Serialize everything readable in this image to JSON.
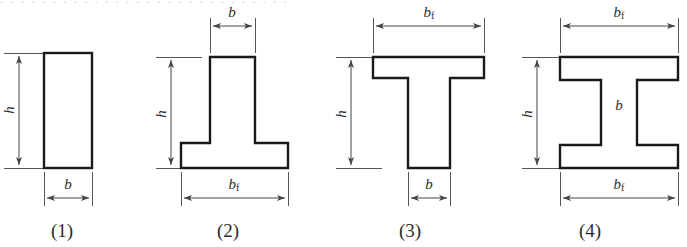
{
  "figure": {
    "background_color": "#ffffff",
    "outline_color": "#1a1a1a",
    "dimension_line_color": "#555555",
    "text_color": "#2b2b2b",
    "top_edge_artifact": ". . .  . . . .  . . .  . . . . . .  . . . .  . . . . . . . ."
  },
  "labels": {
    "h": "h",
    "b": "b",
    "bf_base": "b",
    "bf_sub": "f"
  },
  "shapes": [
    {
      "id": "shape-1",
      "caption": "(1)",
      "name": "rectangular-section",
      "caption_x": 62,
      "dimensions": [
        {
          "name": "height",
          "label": "h",
          "orientation": "vertical"
        },
        {
          "name": "width",
          "label": "b",
          "orientation": "horizontal"
        }
      ]
    },
    {
      "id": "shape-2",
      "caption": "(2)",
      "name": "inverted-t-section",
      "caption_x": 228,
      "dimensions": [
        {
          "name": "height",
          "label": "h",
          "orientation": "vertical"
        },
        {
          "name": "web-width",
          "label": "b",
          "orientation": "horizontal"
        },
        {
          "name": "flange-width",
          "label": "bf",
          "orientation": "horizontal"
        }
      ]
    },
    {
      "id": "shape-3",
      "caption": "(3)",
      "name": "t-section",
      "caption_x": 410,
      "dimensions": [
        {
          "name": "height",
          "label": "h",
          "orientation": "vertical"
        },
        {
          "name": "flange-width",
          "label": "bf",
          "orientation": "horizontal"
        },
        {
          "name": "web-width",
          "label": "b",
          "orientation": "horizontal"
        }
      ]
    },
    {
      "id": "shape-4",
      "caption": "(4)",
      "name": "i-section",
      "caption_x": 590,
      "dimensions": [
        {
          "name": "height",
          "label": "h",
          "orientation": "vertical"
        },
        {
          "name": "top-flange-width",
          "label": "bf",
          "orientation": "horizontal"
        },
        {
          "name": "web-width",
          "label": "b",
          "orientation": "horizontal"
        },
        {
          "name": "bottom-flange-width",
          "label": "bf",
          "orientation": "horizontal"
        }
      ]
    }
  ]
}
